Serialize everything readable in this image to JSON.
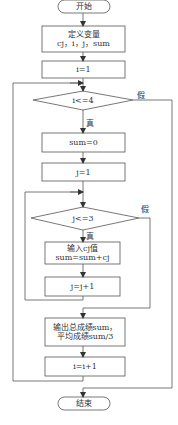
{
  "diagram": {
    "type": "flowchart",
    "line_color": "#444444",
    "nodes": {
      "start": {
        "label": "开始",
        "shape": "terminal"
      },
      "declare": {
        "line1": "定义变量",
        "line2": "cj，i，j，sum",
        "shape": "process"
      },
      "init_i": {
        "label": "i=1",
        "shape": "process"
      },
      "cond_i": {
        "label": "i<=4",
        "shape": "decision",
        "true_label": "真",
        "false_label": "假"
      },
      "init_sum": {
        "label": "sum=0",
        "shape": "process"
      },
      "init_j": {
        "label": "j=1",
        "shape": "process"
      },
      "cond_j": {
        "label": "j<=3",
        "shape": "decision",
        "true_label": "真",
        "false_label": "假"
      },
      "input": {
        "line1": "输入cj值",
        "line2": "sum=sum+cj",
        "shape": "process"
      },
      "inc_j": {
        "label": "j=j+1",
        "shape": "process"
      },
      "output": {
        "line1": "输出总成绩sum，",
        "line2": "平均成绩sum/3",
        "shape": "process"
      },
      "inc_i": {
        "label": "i=i+1",
        "shape": "process"
      },
      "end": {
        "label": "结束",
        "shape": "terminal"
      }
    },
    "edges": [
      [
        "start",
        "declare"
      ],
      [
        "declare",
        "init_i"
      ],
      [
        "init_i",
        "cond_i"
      ],
      [
        "cond_i",
        "init_sum",
        "真"
      ],
      [
        "cond_i",
        "end",
        "假"
      ],
      [
        "init_sum",
        "init_j"
      ],
      [
        "init_j",
        "cond_j"
      ],
      [
        "cond_j",
        "input",
        "真"
      ],
      [
        "cond_j",
        "output",
        "假"
      ],
      [
        "input",
        "inc_j"
      ],
      [
        "inc_j",
        "cond_j"
      ],
      [
        "output",
        "inc_i"
      ],
      [
        "inc_i",
        "cond_i"
      ]
    ]
  }
}
